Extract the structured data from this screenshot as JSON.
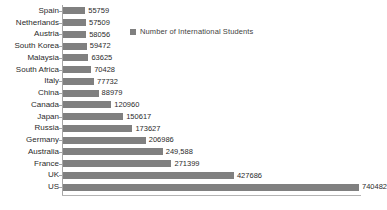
{
  "chart_data": {
    "type": "bar",
    "orientation": "horizontal",
    "title": "",
    "xlabel": "",
    "ylabel": "",
    "grid": false,
    "legend_position": "top-right",
    "series_name": "Number of International Students",
    "xlim": [
      0,
      740482
    ],
    "categories": [
      "Spain",
      "Netherlands",
      "Austria",
      "South Korea",
      "Malaysia",
      "South Africa",
      "Italy",
      "China",
      "Canada",
      "Japan",
      "Russia",
      "Germany",
      "Australia",
      "France",
      "UK",
      "US"
    ],
    "values": [
      55759,
      57509,
      58056,
      59472,
      63625,
      70428,
      77732,
      88979,
      120960,
      150617,
      173627,
      206986,
      249588,
      271399,
      427686,
      740482
    ],
    "value_labels": [
      "55759",
      "57509",
      "58056",
      "59472",
      "63625",
      "70428",
      "77732",
      "88979",
      "120960",
      "150617",
      "173627",
      "206986",
      "249,588",
      "271399",
      "427686",
      "740482"
    ],
    "colors": {
      "bar": "#808080",
      "axis": "#a6a6a6",
      "text": "#2b2b2b",
      "legend_text": "#3f3f3f"
    }
  },
  "legend": {
    "label": "Number of International Students",
    "swatch_color": "#7f7f7f"
  }
}
